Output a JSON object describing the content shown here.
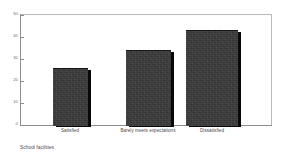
{
  "chart_data": {
    "type": "bar",
    "title": "",
    "subtitle": "",
    "caption": "School facilities",
    "xlabel": "",
    "ylabel": "",
    "categories": [
      "Satisfied",
      "Barely meets expectations",
      "Dissatisfied"
    ],
    "values": [
      26,
      34,
      43
    ],
    "ylim": [
      0,
      50
    ],
    "yticks": [
      0,
      10,
      20,
      30,
      40,
      50
    ],
    "ytick_labels": [
      "0",
      "10",
      "20",
      "30",
      "40",
      "50"
    ],
    "grid": false,
    "legend": null,
    "bar_color": "#3b3b3b",
    "bar_shadow_color": "#080808",
    "axis_color": "#8e8e8e",
    "frame_color": "#b9b9b9",
    "text_color": "#4a4a4a",
    "background": "#ffffff",
    "style": "3d-shadow-bars"
  }
}
